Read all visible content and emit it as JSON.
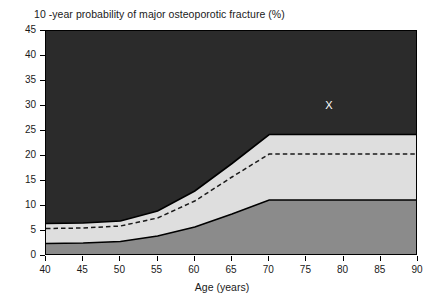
{
  "chart_data": {
    "type": "area",
    "title": "10 -year probability of major osteoporotic fracture (%)",
    "xlabel": "Age (years)",
    "ylabel": "",
    "xlim": [
      40,
      90
    ],
    "ylim": [
      0,
      45
    ],
    "xticks": [
      40,
      45,
      50,
      55,
      60,
      65,
      70,
      75,
      80,
      85,
      90
    ],
    "yticks": [
      0,
      5,
      10,
      15,
      20,
      25,
      30,
      35,
      40,
      45
    ],
    "grid": false,
    "legend_position": "none",
    "x": [
      40,
      45,
      50,
      55,
      60,
      65,
      70,
      75,
      80,
      85,
      90
    ],
    "series": [
      {
        "name": "Upper band boundary (high risk threshold)",
        "style": "solid",
        "color": "#000000",
        "values": [
          6.5,
          6.6,
          7.0,
          9.0,
          13.0,
          18.5,
          24.3,
          24.3,
          24.3,
          24.3,
          24.3
        ]
      },
      {
        "name": "Intervention threshold (dashed)",
        "style": "dashed",
        "color": "#1a1a1a",
        "values": [
          5.5,
          5.6,
          6.0,
          7.6,
          11.0,
          15.8,
          20.4,
          20.4,
          20.4,
          20.4,
          20.4
        ]
      },
      {
        "name": "Lower band boundary (low risk threshold)",
        "style": "solid",
        "color": "#000000",
        "values": [
          2.5,
          2.6,
          2.9,
          4.0,
          5.8,
          8.4,
          11.2,
          11.2,
          11.2,
          11.2,
          11.2
        ]
      }
    ],
    "bands": [
      {
        "name": "high-risk-region",
        "color": "#2b2b2b",
        "from_series": "Upper band boundary (high risk threshold)",
        "to": 45
      },
      {
        "name": "intermediate-risk-region",
        "color": "#dedede",
        "from_series": "Lower band boundary (low risk threshold)",
        "to_series": "Upper band boundary (high risk threshold)"
      },
      {
        "name": "low-risk-region",
        "color": "#8b8b8b",
        "from": 0,
        "to_series": "Lower band boundary (low risk threshold)"
      }
    ],
    "annotations": [
      {
        "name": "patient-marker",
        "label": "X",
        "x": 78,
        "y": 30,
        "color": "#ffffff"
      }
    ]
  },
  "colors": {
    "axis": "#000000",
    "text": "#1a1a1a",
    "high_risk": "#2b2b2b",
    "intermediate_risk": "#dedede",
    "low_risk": "#8b8b8b",
    "marker": "#ffffff",
    "background": "#ffffff"
  }
}
